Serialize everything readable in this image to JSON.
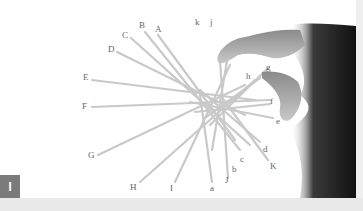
{
  "figure": {
    "badge": "I",
    "badge_color": "#7a7a7a",
    "background_color": "#ffffff"
  },
  "labels": {
    "A": "A",
    "B": "B",
    "C": "C",
    "D": "D",
    "E": "E",
    "F": "F",
    "G": "G",
    "H": "H",
    "I": "I",
    "J": "J",
    "K": "K",
    "a": "a",
    "b": "b",
    "c": "c",
    "d": "d",
    "e": "e",
    "f": "f",
    "g": "g",
    "h": "h",
    "j": "j",
    "k": "k"
  }
}
